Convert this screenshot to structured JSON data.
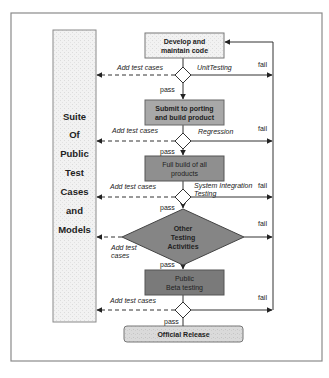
{
  "diagram": {
    "colors": {
      "border": "#8a8a8a",
      "line": "#333333",
      "light_box": "#e8e8e8",
      "mid_box": "#a8a8a8",
      "dark_box": "#8f8f8f",
      "darker_box": "#7a7a7a",
      "suite_fill": "#f0f0f0"
    },
    "suite": {
      "lines": [
        "Suite",
        "Of",
        "Public",
        "Test",
        "Cases",
        "and",
        "Models"
      ]
    },
    "nodes": {
      "develop": {
        "line1": "Develop and",
        "line2": "maintain code"
      },
      "submit": {
        "line1": "Submit to porting",
        "line2": "and build product"
      },
      "full_build": {
        "line1": "Full build of all",
        "line2": "products"
      },
      "other_testing": {
        "line1": "Other",
        "line2": "Testing",
        "line3": "Activities"
      },
      "public_beta": {
        "line1": "Public",
        "line2": "Beta testing"
      },
      "official_release": {
        "label": "Official Release"
      }
    },
    "decisions": [
      {
        "name": "Unit Testing",
        "label": "UnitTesting"
      },
      {
        "name": "Regression",
        "label": "Regression"
      },
      {
        "name": "System Integration Testing",
        "line1": "System Integration",
        "line2": "Testing"
      },
      {
        "name": "Other Testing Activities",
        "label": "Other Testing Activities"
      },
      {
        "name": "Public Beta testing",
        "label": ""
      }
    ],
    "edge_labels": {
      "add_test_cases": "Add test cases",
      "add_test_line1": "Add test",
      "add_test_line2": "cases",
      "pass": "pass",
      "fail": "fail"
    }
  }
}
